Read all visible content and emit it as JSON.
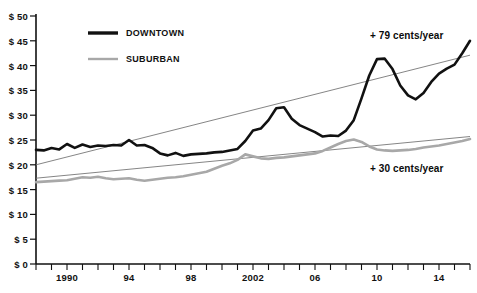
{
  "chart_data": {
    "type": "line",
    "title": "",
    "xlabel": "",
    "ylabel": "",
    "xlim": [
      1988,
      2016
    ],
    "ylim": [
      0,
      50
    ],
    "ytick_step": 5,
    "grid": false,
    "legend_position": "top-left-inside",
    "ytick_labels": [
      "$ 0",
      "$ 5",
      "$ 10",
      "$ 15",
      "$ 20",
      "$ 25",
      "$ 30",
      "$ 35",
      "$ 40",
      "$ 45",
      "$ 50"
    ],
    "ytick_values": [
      0,
      5,
      10,
      15,
      20,
      25,
      30,
      35,
      40,
      45,
      50
    ],
    "xtick_values": [
      1988,
      1989,
      1990,
      1991,
      1992,
      1993,
      1994,
      1995,
      1996,
      1997,
      1998,
      1999,
      2000,
      2001,
      2002,
      2003,
      2004,
      2005,
      2006,
      2007,
      2008,
      2009,
      2010,
      2011,
      2012,
      2013,
      2014,
      2015,
      2016
    ],
    "xtick_labeled": [
      {
        "value": 1990,
        "label": "1990"
      },
      {
        "value": 1994,
        "label": "94"
      },
      {
        "value": 1998,
        "label": "98"
      },
      {
        "value": 2002,
        "label": "2002"
      },
      {
        "value": 2006,
        "label": "06"
      },
      {
        "value": 2010,
        "label": "10"
      },
      {
        "value": 2014,
        "label": "14"
      }
    ],
    "x": [
      1988,
      1988.5,
      1989,
      1989.5,
      1990,
      1990.5,
      1991,
      1991.5,
      1992,
      1992.5,
      1993,
      1993.5,
      1994,
      1994.5,
      1995,
      1995.5,
      1996,
      1996.5,
      1997,
      1997.5,
      1998,
      1998.5,
      1999,
      1999.5,
      2000,
      2000.5,
      2001,
      2001.5,
      2002,
      2002.5,
      2003,
      2003.5,
      2004,
      2004.5,
      2005,
      2005.5,
      2006,
      2006.5,
      2007,
      2007.5,
      2008,
      2008.5,
      2009,
      2009.5,
      2010,
      2010.5,
      2011,
      2011.5,
      2012,
      2012.5,
      2013,
      2013.5,
      2014,
      2014.5,
      2015,
      2015.5,
      2016
    ],
    "series": [
      {
        "name": "DOWNTOWN",
        "color": "#111111",
        "width": 2.6,
        "values": [
          23.0,
          22.9,
          23.4,
          23.1,
          24.2,
          23.4,
          24.1,
          23.6,
          23.9,
          23.8,
          24.0,
          23.9,
          25.0,
          23.9,
          24.0,
          23.4,
          22.3,
          21.9,
          22.4,
          21.8,
          22.1,
          22.2,
          22.3,
          22.5,
          22.6,
          22.9,
          23.2,
          24.8,
          26.9,
          27.3,
          29.0,
          31.4,
          31.6,
          29.3,
          28.0,
          27.3,
          26.6,
          25.7,
          25.9,
          25.8,
          26.9,
          29.0,
          33.4,
          38.0,
          41.3,
          41.4,
          39.3,
          36.0,
          34.0,
          33.2,
          34.5,
          36.7,
          38.4,
          39.4,
          40.2,
          42.5,
          45.0
        ]
      },
      {
        "name": "SUBURBAN",
        "color": "#a8a8a8",
        "width": 2.6,
        "values": [
          16.5,
          16.6,
          16.7,
          16.8,
          16.9,
          17.2,
          17.5,
          17.4,
          17.6,
          17.3,
          17.1,
          17.2,
          17.3,
          17.0,
          16.8,
          17.0,
          17.2,
          17.4,
          17.5,
          17.7,
          18.0,
          18.3,
          18.6,
          19.2,
          19.8,
          20.3,
          21.0,
          22.1,
          21.7,
          21.3,
          21.2,
          21.4,
          21.5,
          21.7,
          21.9,
          22.1,
          22.3,
          22.8,
          23.5,
          24.2,
          24.8,
          25.1,
          24.6,
          23.7,
          23.1,
          22.9,
          22.8,
          22.9,
          23.0,
          23.2,
          23.5,
          23.7,
          23.9,
          24.2,
          24.5,
          24.8,
          25.2
        ]
      }
    ],
    "trendlines": [
      {
        "name": "downtown-trend",
        "color": "#777777",
        "width": 0.9,
        "slope_label": "+ 79 cents/year",
        "x0": 1988,
        "y0": 20.0,
        "x1": 2016,
        "y1": 42.1
      },
      {
        "name": "suburban-trend",
        "color": "#777777",
        "width": 0.9,
        "slope_label": "+ 30 cents/year",
        "x0": 1988,
        "y0": 17.3,
        "x1": 2016,
        "y1": 25.7
      }
    ],
    "annotations": [
      {
        "text": "+ 79 cents/year",
        "x_px": 370,
        "y_px": 30
      },
      {
        "text": "+ 30 cents/year",
        "x_px": 370,
        "y_px": 163
      }
    ],
    "legend": [
      {
        "label": "DOWNTOWN",
        "color": "#111111",
        "width": 3.4
      },
      {
        "label": "SUBURBAN",
        "color": "#a8a8a8",
        "width": 2.4
      }
    ]
  }
}
